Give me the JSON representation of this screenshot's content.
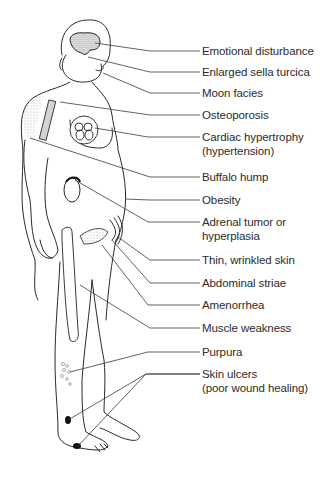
{
  "diagram": {
    "line_color": "#3a3a3a",
    "labels": [
      {
        "id": "emotional-disturbance",
        "text": "Emotional disturbance",
        "line2": "",
        "y": 44,
        "target": [
          95,
          43
        ],
        "elbow": 150
      },
      {
        "id": "enlarged-sella-turcica",
        "text": "Enlarged sella turcica",
        "line2": "",
        "y": 65,
        "target": [
          88,
          57
        ],
        "elbow": 150
      },
      {
        "id": "moon-facies",
        "text": "Moon facies",
        "line2": "",
        "y": 86,
        "target": [
          103,
          73
        ],
        "elbow": 150
      },
      {
        "id": "osteoporosis",
        "text": "Osteoporosis",
        "line2": "",
        "y": 108,
        "target": [
          60,
          102
        ],
        "elbow": 150
      },
      {
        "id": "cardiac-hypertrophy",
        "text": "Cardiac hypertrophy",
        "line2": "(hypertension)",
        "y": 130,
        "target": [
          95,
          128
        ],
        "elbow": 148
      },
      {
        "id": "buffalo-hump",
        "text": "Buffalo hump",
        "line2": "",
        "y": 170,
        "target": [
          30,
          138
        ],
        "elbow": 150
      },
      {
        "id": "obesity",
        "text": "Obesity",
        "line2": "",
        "y": 193,
        "target": [
          125,
          199
        ],
        "elbow": 150
      },
      {
        "id": "adrenal-tumor",
        "text": "Adrenal tumor or",
        "line2": "hyperplasia",
        "y": 215,
        "target": [
          75,
          180
        ],
        "elbow": 148
      },
      {
        "id": "thin-wrinkled-skin",
        "text": "Thin, wrinkled skin",
        "line2": "",
        "y": 253,
        "target": [
          118,
          237
        ],
        "elbow": 150
      },
      {
        "id": "abdominal-striae",
        "text": "Abdominal striae",
        "line2": "",
        "y": 276,
        "target": [
          112,
          240
        ],
        "elbow": 150
      },
      {
        "id": "amenorrhea",
        "text": "Amenorrhea",
        "line2": "",
        "y": 298,
        "target": [
          102,
          245
        ],
        "elbow": 148
      },
      {
        "id": "muscle-weakness",
        "text": "Muscle weakness",
        "line2": "",
        "y": 321,
        "target": [
          80,
          285
        ],
        "elbow": 150
      },
      {
        "id": "purpura",
        "text": "Purpura",
        "line2": "",
        "y": 345,
        "target": [
          70,
          372
        ],
        "elbow": 148
      },
      {
        "id": "skin-ulcers",
        "text": "Skin ulcers",
        "line2": "(poor wound healing)",
        "y": 367,
        "target": [
          68,
          420
        ],
        "target2": [
          77,
          447
        ],
        "elbow": 146
      }
    ]
  }
}
